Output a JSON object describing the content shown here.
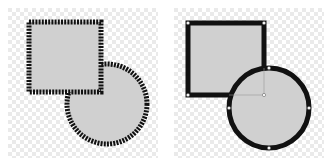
{
  "panels": [
    {
      "id": "left",
      "description": "Shapes with dotted/beaded outline",
      "outline_style": "dotted",
      "square": {
        "x": 29,
        "y": 22,
        "w": 72,
        "h": 70
      },
      "circle": {
        "cx": 107,
        "cy": 104,
        "r": 40
      }
    },
    {
      "id": "right",
      "description": "Shapes with solid outline and selection handles",
      "outline_style": "solid",
      "square": {
        "x": 22,
        "y": 23,
        "w": 76,
        "h": 72
      },
      "circle": {
        "cx": 103,
        "cy": 108,
        "r": 40
      }
    }
  ],
  "colors": {
    "fill": "#d0d0d0",
    "stroke": "#111111",
    "checker_light": "#ffffff",
    "checker_dark": "#ececec",
    "handle": "#ffffff"
  }
}
